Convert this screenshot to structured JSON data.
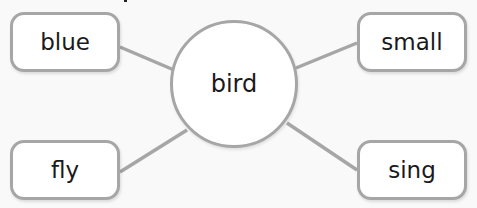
{
  "diagram": {
    "type": "word-web",
    "center": {
      "label": "bird"
    },
    "nodes": [
      {
        "position": "top-left",
        "label": "blue"
      },
      {
        "position": "top-right",
        "label": "small"
      },
      {
        "position": "bottom-left",
        "label": "fly"
      },
      {
        "position": "bottom-right",
        "label": "sing"
      }
    ],
    "colors": {
      "border": "#a6a6a6",
      "connector": "#a6a6a6",
      "fill": "#ffffff",
      "background": "#f9f9f9",
      "text": "#1a1a1a"
    }
  }
}
